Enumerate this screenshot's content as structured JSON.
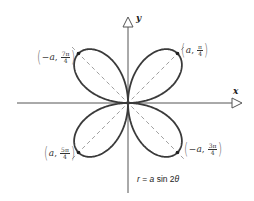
{
  "diagram": {
    "type": "polar-rose",
    "equation": {
      "r": "r",
      "equals": " = ",
      "a": "a",
      "rest": " sin 2",
      "theta": "θ"
    },
    "axes": {
      "x_label": "x",
      "y_label": "y"
    },
    "points": [
      {
        "sign": "",
        "a": "a",
        "num": "π",
        "den": "4",
        "position": "upper-right"
      },
      {
        "sign": "−",
        "a": "a",
        "num": "7π",
        "den": "4",
        "position": "upper-left"
      },
      {
        "sign": "",
        "a": "a",
        "num": "5π",
        "den": "4",
        "position": "lower-left"
      },
      {
        "sign": "−",
        "a": "a",
        "num": "3π",
        "den": "4",
        "position": "lower-right"
      }
    ],
    "colors": {
      "curve": "#3a3a3a",
      "axes": "#555555",
      "guide": "#888888"
    }
  }
}
